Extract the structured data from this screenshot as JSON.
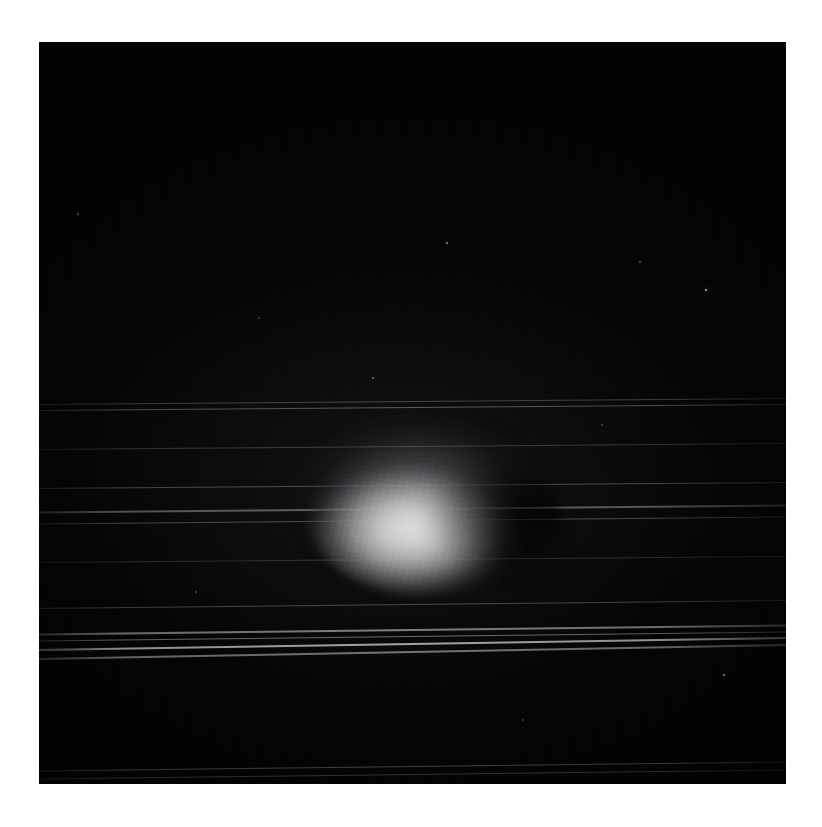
{
  "figure": {
    "medium": "monochrome astronomical exposure",
    "background_color": "#ffffff",
    "frame_color": "#000000",
    "frame": {
      "x": 39,
      "y": 42,
      "width": 747,
      "height": 742
    }
  },
  "chart_data": {
    "type": "scatter",
    "title": "",
    "xlabel": "",
    "ylabel": "",
    "grid": false,
    "legend": null,
    "planet": {
      "label": "planet-disk",
      "center_x": 393,
      "center_y": 479,
      "width": 252,
      "height": 152,
      "peak_brightness": 214,
      "core_brightness": 232,
      "shading": "limb-darkened toward right/trailing edge"
    },
    "rings": [
      {
        "name": "ring-1",
        "y_left": 404,
        "y_right": 398,
        "thickness": 1.0,
        "brightness": 26
      },
      {
        "name": "ring-2",
        "y_left": 411,
        "y_right": 405,
        "thickness": 1.3,
        "brightness": 34
      },
      {
        "name": "ring-3",
        "y_left": 449,
        "y_right": 443,
        "thickness": 1.0,
        "brightness": 22
      },
      {
        "name": "ring-4",
        "y_left": 489,
        "y_right": 483,
        "thickness": 1.2,
        "brightness": 30
      },
      {
        "name": "ring-5",
        "y_left": 512,
        "y_right": 505,
        "thickness": 1.5,
        "brightness": 38
      },
      {
        "name": "ring-6",
        "y_left": 524,
        "y_right": 517,
        "thickness": 1.2,
        "brightness": 30
      },
      {
        "name": "ring-7",
        "y_left": 562,
        "y_right": 556,
        "thickness": 1.0,
        "brightness": 18
      },
      {
        "name": "ring-8",
        "y_left": 609,
        "y_right": 601,
        "thickness": 1.2,
        "brightness": 28
      },
      {
        "name": "ring-9",
        "y_left": 634,
        "y_right": 625,
        "thickness": 1.6,
        "brightness": 52
      },
      {
        "name": "ring-10",
        "y_left": 641,
        "y_right": 632,
        "thickness": 1.4,
        "brightness": 44
      },
      {
        "name": "ring-11",
        "y_left": 650,
        "y_right": 638,
        "thickness": 2.0,
        "brightness": 70
      },
      {
        "name": "ring-12",
        "y_left": 659,
        "y_right": 645,
        "thickness": 1.6,
        "brightness": 48
      },
      {
        "name": "ring-13",
        "y_left": 771,
        "y_right": 762,
        "thickness": 1.2,
        "brightness": 26
      },
      {
        "name": "ring-14",
        "y_left": 779,
        "y_right": 770,
        "thickness": 1.0,
        "brightness": 20
      }
    ],
    "point_sources": [
      {
        "name": "star-1",
        "x": 447,
        "y": 243,
        "brightness": 70,
        "size": 2.0
      },
      {
        "name": "star-2",
        "x": 706,
        "y": 290,
        "brightness": 96,
        "size": 2.4
      },
      {
        "name": "star-3",
        "x": 373,
        "y": 378,
        "brightness": 54,
        "size": 1.8
      },
      {
        "name": "star-4",
        "x": 724,
        "y": 675,
        "brightness": 66,
        "size": 2.0
      },
      {
        "name": "star-5",
        "x": 78,
        "y": 214,
        "brightness": 40,
        "size": 1.6
      },
      {
        "name": "star-6",
        "x": 640,
        "y": 262,
        "brightness": 36,
        "size": 1.4
      },
      {
        "name": "star-7",
        "x": 602,
        "y": 425,
        "brightness": 32,
        "size": 1.4
      },
      {
        "name": "star-8",
        "x": 196,
        "y": 592,
        "brightness": 30,
        "size": 1.4
      },
      {
        "name": "star-9",
        "x": 523,
        "y": 720,
        "brightness": 28,
        "size": 1.4
      },
      {
        "name": "star-10",
        "x": 259,
        "y": 318,
        "brightness": 26,
        "size": 1.2
      }
    ]
  }
}
